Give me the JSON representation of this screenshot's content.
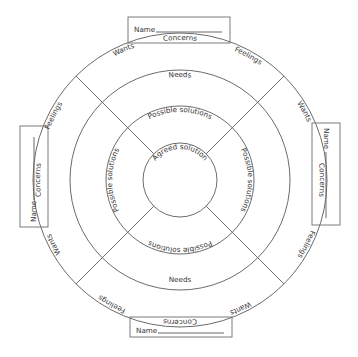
{
  "diagram": {
    "type": "concentric-conflict-resolution-wheel",
    "center": [
      180,
      180
    ],
    "rings": {
      "outer_band": {
        "labels_per_party": [
          "Concerns",
          "Feelings",
          "Wants"
        ]
      },
      "needs_band": {
        "label": "Needs"
      },
      "solutions_band": {
        "label": "Possible solutions"
      },
      "core": {
        "label": "Agreed solution"
      }
    },
    "parties": [
      {
        "position": "top",
        "name_label": "Name",
        "concerns": "Concerns",
        "feelings": "Feelings",
        "wants": "Wants",
        "needs": "Needs",
        "solutions": "Possible solutions"
      },
      {
        "position": "right",
        "name_label": "Name",
        "concerns": "Concerns",
        "feelings": "Feelings",
        "wants": "Wants",
        "needs": "Needs",
        "solutions": "Possible solutions"
      },
      {
        "position": "bottom",
        "name_label": "Name",
        "concerns": "Concerns",
        "feelings": "Feelings",
        "wants": "Wants",
        "needs": "Needs",
        "solutions": "Possible solutions"
      },
      {
        "position": "left",
        "name_label": "Name",
        "concerns": "Concerns",
        "feelings": "Feelings",
        "wants": "Wants",
        "needs": "Needs",
        "solutions": "Possible solutions"
      }
    ],
    "core_label": "Agreed solution",
    "colors": {
      "line": "#6b6b6b",
      "text": "#333333",
      "background": "#ffffff"
    }
  }
}
